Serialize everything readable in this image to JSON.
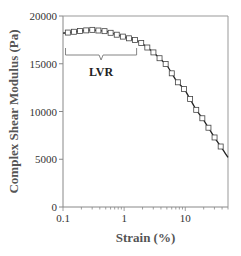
{
  "chart_data": {
    "type": "line",
    "title": "",
    "xlabel": "Strain (%)",
    "ylabel": "Complex Shear Modulus (Pa)",
    "xscale": "log",
    "xlim": [
      0.1,
      50
    ],
    "ylim": [
      0,
      20000
    ],
    "grid": false,
    "legend": "none",
    "xticks": [
      {
        "value": 0.1,
        "label": "0.1"
      },
      {
        "value": 1,
        "label": "1"
      },
      {
        "value": 10,
        "label": "10"
      }
    ],
    "yticks": [
      {
        "value": 0,
        "label": "0"
      },
      {
        "value": 5000,
        "label": "5000"
      },
      {
        "value": 10000,
        "label": "10000"
      },
      {
        "value": 15000,
        "label": "15000"
      },
      {
        "value": 20000,
        "label": "20000"
      }
    ],
    "series": [
      {
        "name": "Fitted curve",
        "style": "solid-line",
        "x": [
          0.1,
          0.2,
          0.3,
          0.5,
          1.0,
          1.5,
          2.0,
          3.0,
          5.0,
          7.0,
          10,
          15,
          20,
          30,
          50
        ],
        "y": [
          18200,
          18450,
          18550,
          18400,
          17800,
          17500,
          17100,
          16200,
          14850,
          13300,
          12200,
          10200,
          9100,
          7300,
          5200
        ]
      },
      {
        "name": "Measured data",
        "style": "open-square-markers",
        "marker_x_range": [
          0.12,
          45
        ],
        "marker_step_decades": 0.1
      }
    ],
    "annotations": [
      {
        "type": "bracket",
        "label": "LVR",
        "x_range": [
          0.11,
          1.6
        ],
        "meaning": "Linear viscoelastic region"
      }
    ]
  }
}
